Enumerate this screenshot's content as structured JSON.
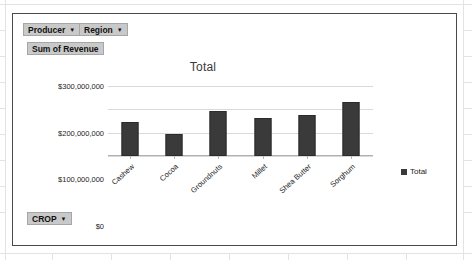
{
  "panel": {
    "name": "pivot-chart-panel"
  },
  "filters": {
    "producer": {
      "label": "Producer",
      "caret": "▼"
    },
    "region": {
      "label": "Region",
      "caret": "▼"
    },
    "values_field": {
      "label": "Sum of Revenue"
    },
    "crop": {
      "label": "CROP",
      "caret": "▼"
    }
  },
  "legend": {
    "position": "right",
    "entries": [
      {
        "label": "Total",
        "color": "#3a3a3a"
      }
    ]
  },
  "colors": {
    "bar": "#3a3a3a",
    "button_face": "#c9c9c9",
    "gridline": "#d9d9d9",
    "panel_border": "#4a4a4a"
  },
  "chart_data": {
    "type": "bar",
    "title": "Total",
    "xlabel": "",
    "ylabel": "",
    "categories": [
      "Cashew",
      "Cocoa",
      "Groundnuts",
      "Millet",
      "Shea Butter",
      "Sorghum"
    ],
    "values": [
      145000000,
      95000000,
      195000000,
      165000000,
      175000000,
      230000000
    ],
    "series": [
      {
        "name": "Total",
        "values": [
          145000000,
          95000000,
          195000000,
          165000000,
          175000000,
          230000000
        ]
      }
    ],
    "ylim": [
      0,
      300000000
    ],
    "ytick_values": [
      0,
      100000000,
      200000000,
      300000000
    ],
    "ytick_labels": [
      "$0",
      "$100,000,000",
      "$200,000,000",
      "$300,000,000"
    ],
    "grid": true,
    "legend_position": "right"
  }
}
